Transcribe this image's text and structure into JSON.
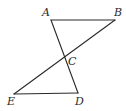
{
  "diagram": {
    "type": "geometry",
    "points": {
      "A": {
        "label": "A",
        "x": 51,
        "y": 20,
        "label_x": 42,
        "label_y": 16
      },
      "B": {
        "label": "B",
        "x": 115,
        "y": 20,
        "label_x": 114,
        "label_y": 16
      },
      "C": {
        "label": "C",
        "x": 64.5,
        "y": 56.6,
        "label_x": 68,
        "label_y": 65
      },
      "D": {
        "label": "D",
        "x": 78,
        "y": 93,
        "label_x": 75,
        "label_y": 105
      },
      "E": {
        "label": "E",
        "x": 14,
        "y": 94,
        "label_x": 7,
        "label_y": 105
      }
    },
    "segments": [
      {
        "name": "AB",
        "from": "A",
        "to": "B"
      },
      {
        "name": "AD",
        "from": "A",
        "to": "D"
      },
      {
        "name": "BE",
        "from": "B",
        "to": "E"
      },
      {
        "name": "ED",
        "from": "E",
        "to": "D"
      }
    ],
    "line_color": "#2a2a2a",
    "background": "#ffffff"
  }
}
